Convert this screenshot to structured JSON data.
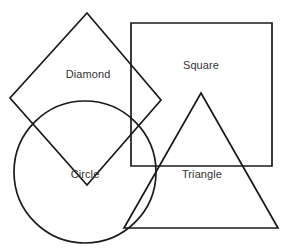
{
  "canvas": {
    "width": 288,
    "height": 252,
    "background_color": "#ffffff",
    "stroke_color": "#1a1a1a",
    "label_color": "#333333",
    "stroke_width": 1.7
  },
  "shapes": [
    {
      "id": "diamond",
      "label": "Diamond",
      "kind": "polygon",
      "points": "87,13 161,100 87,185 10,98",
      "label_x": 88,
      "label_y": 74
    },
    {
      "id": "square",
      "label": "Square",
      "kind": "rect",
      "x": 131,
      "y": 23,
      "width": 141,
      "height": 143,
      "label_x": 201,
      "label_y": 65
    },
    {
      "id": "circle",
      "label": "Circle",
      "kind": "circle",
      "cx": 85,
      "cy": 172,
      "r": 71,
      "label_x": 85,
      "label_y": 174
    },
    {
      "id": "triangle",
      "label": "Triangle",
      "kind": "polygon",
      "points": "201,93 278,228 124,228",
      "label_x": 202,
      "label_y": 174
    }
  ]
}
